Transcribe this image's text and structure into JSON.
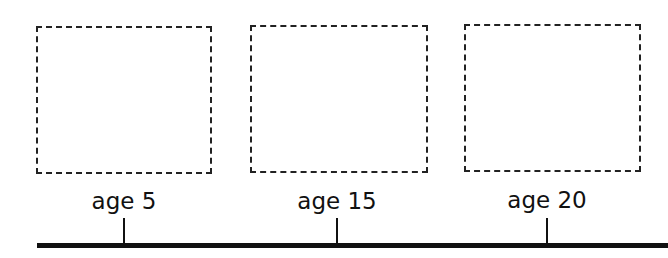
{
  "timeline": {
    "colors": {
      "line": "#111111",
      "box_border": "#222222",
      "background": "#ffffff"
    },
    "entries": [
      {
        "label": "age 5",
        "box": "empty"
      },
      {
        "label": "age 15",
        "box": "empty"
      },
      {
        "label": "age 20",
        "box": "empty"
      }
    ]
  }
}
